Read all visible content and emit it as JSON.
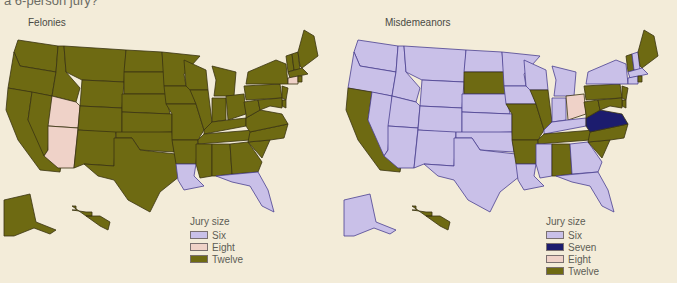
{
  "caption": "a 6-person jury?",
  "colors": {
    "six": "#c9c0e8",
    "seven": "#1c1c6e",
    "eight": "#efd2c8",
    "twelve": "#6e6a12",
    "border": "#3a3412",
    "coast_six": "#2a2470",
    "background": "#f3ecd9"
  },
  "legend": {
    "title": "Jury size",
    "felonies_items": [
      {
        "label": "Six",
        "key": "six"
      },
      {
        "label": "Eight",
        "key": "eight"
      },
      {
        "label": "Twelve",
        "key": "twelve"
      }
    ],
    "misdemeanors_items": [
      {
        "label": "Six",
        "key": "six"
      },
      {
        "label": "Seven",
        "key": "seven"
      },
      {
        "label": "Eight",
        "key": "eight"
      },
      {
        "label": "Twelve",
        "key": "twelve"
      }
    ]
  },
  "panels": {
    "felonies": {
      "title": "Felonies"
    },
    "misdemeanors": {
      "title": "Misdemeanors"
    }
  },
  "chart_data": [
    {
      "type": "choropleth-map",
      "title": "Felonies",
      "legend_title": "Jury size",
      "legend": [
        "Six",
        "Eight",
        "Twelve"
      ],
      "default": "Twelve",
      "states": {
        "Six": [
          "LA",
          "FL"
        ],
        "Eight": [
          "UT",
          "AZ",
          "CT"
        ],
        "Twelve": [
          "WA",
          "OR",
          "CA",
          "ID",
          "NV",
          "MT",
          "WY",
          "CO",
          "NM",
          "ND",
          "SD",
          "NE",
          "KS",
          "OK",
          "TX",
          "MN",
          "IA",
          "MO",
          "AR",
          "WI",
          "IL",
          "MI",
          "IN",
          "OH",
          "KY",
          "TN",
          "MS",
          "AL",
          "GA",
          "SC",
          "NC",
          "VA",
          "WV",
          "PA",
          "NY",
          "NJ",
          "DE",
          "MD",
          "VT",
          "NH",
          "ME",
          "MA",
          "RI",
          "AK",
          "HI"
        ]
      }
    },
    {
      "type": "choropleth-map",
      "title": "Misdemeanors",
      "legend_title": "Jury size",
      "legend": [
        "Six",
        "Seven",
        "Eight",
        "Twelve"
      ],
      "states": {
        "Six": [
          "WA",
          "OR",
          "ID",
          "NV",
          "MT",
          "WY",
          "UT",
          "CO",
          "AZ",
          "NM",
          "ND",
          "NE",
          "KS",
          "OK",
          "TX",
          "MN",
          "IA",
          "WI",
          "MI",
          "IN",
          "KY",
          "LA",
          "MS",
          "GA",
          "FL",
          "NY",
          "NH",
          "MA",
          "CT",
          "AK"
        ],
        "Seven": [
          "VA"
        ],
        "Eight": [
          "OH"
        ],
        "Twelve": [
          "CA",
          "SD",
          "MO",
          "AR",
          "IL",
          "TN",
          "AL",
          "NC",
          "SC",
          "WV",
          "PA",
          "NJ",
          "DE",
          "MD",
          "VT",
          "ME",
          "RI",
          "HI"
        ]
      }
    }
  ]
}
